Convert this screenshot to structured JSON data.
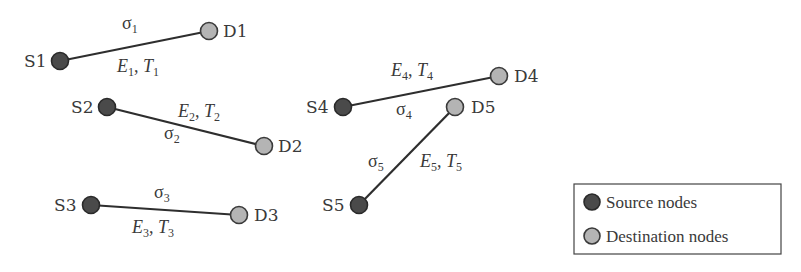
{
  "diagram": {
    "colors": {
      "source_fill": "#4a4a4a",
      "destination_fill": "#b4b4b4",
      "edge": "#2e2e2e",
      "text": "#3a3a3a"
    },
    "links": [
      {
        "id": 1,
        "source": {
          "label": "S1",
          "x": 60,
          "y": 61
        },
        "destination": {
          "label": "D1",
          "x": 209,
          "y": 31
        },
        "sigma": "σ",
        "sigma_sub": "1",
        "energy": "E",
        "energy_sub": "1",
        "time": "T",
        "time_sub": "1"
      },
      {
        "id": 2,
        "source": {
          "label": "S2",
          "x": 107,
          "y": 107
        },
        "destination": {
          "label": "D2",
          "x": 264,
          "y": 146
        },
        "sigma": "σ",
        "sigma_sub": "2",
        "energy": "E",
        "energy_sub": "2",
        "time": "T",
        "time_sub": "2"
      },
      {
        "id": 3,
        "source": {
          "label": "S3",
          "x": 91,
          "y": 205
        },
        "destination": {
          "label": "D3",
          "x": 239,
          "y": 215
        },
        "sigma": "σ",
        "sigma_sub": "3",
        "energy": "E",
        "energy_sub": "3",
        "time": "T",
        "time_sub": "3"
      },
      {
        "id": 4,
        "source": {
          "label": "S4",
          "x": 343,
          "y": 107
        },
        "destination": {
          "label": "D4",
          "x": 499,
          "y": 76
        },
        "sigma": "σ",
        "sigma_sub": "4",
        "energy": "E",
        "energy_sub": "4",
        "time": "T",
        "time_sub": "4"
      },
      {
        "id": 5,
        "source": {
          "label": "S5",
          "x": 359,
          "y": 205
        },
        "destination": {
          "label": "D5",
          "x": 455,
          "y": 107
        },
        "sigma": "σ",
        "sigma_sub": "5",
        "energy": "E",
        "energy_sub": "5",
        "time": "T",
        "time_sub": "5"
      }
    ],
    "separator": ", ",
    "legend": {
      "source_label": "Source nodes",
      "destination_label": "Destination nodes"
    }
  }
}
